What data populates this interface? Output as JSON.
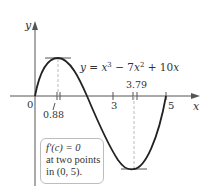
{
  "axes": {
    "x_label": "x",
    "y_label": "y",
    "origin_label": "0",
    "x_ticks": [
      {
        "value": 3,
        "label": "3"
      },
      {
        "value": 5,
        "label": "5"
      }
    ]
  },
  "function_label": "y = x³ − 7x² + 10x",
  "critical_points": [
    {
      "x": 0.88,
      "label": "0.88",
      "type": "max"
    },
    {
      "x": 3.79,
      "label": "3.79",
      "type": "min"
    }
  ],
  "callout": {
    "line1": "f′(c) = 0",
    "line2": "at two points",
    "line3": "in (0, 5)."
  },
  "colors": {
    "curve": "#222222",
    "axis": "#555555",
    "dashed": "#bbbbbb",
    "callout_border": "#bdbdbd"
  }
}
